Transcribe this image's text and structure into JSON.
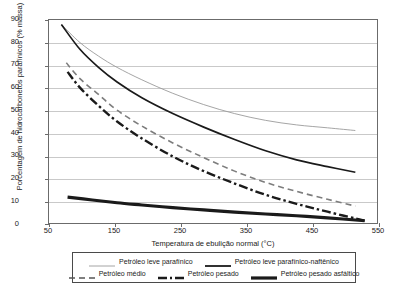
{
  "chart_data": {
    "type": "line",
    "title": "",
    "xlabel": "Temperatura de ebulição normal (°C)",
    "ylabel": "Porcentagem de hidrocarbonetos parafínicos (% massa)",
    "xlim": [
      50,
      580
    ],
    "ylim": [
      0,
      90
    ],
    "xticks": [
      50,
      150,
      250,
      350,
      450,
      550
    ],
    "yticks": [
      0,
      10,
      20,
      30,
      40,
      50,
      60,
      70,
      80,
      90
    ],
    "grid": "horizontal",
    "legend_position": "bottom",
    "series": [
      {
        "name": "Petróleo leve parafínico",
        "style": "thin-solid-gray",
        "color": "#9a9a9a",
        "width": 0.9,
        "points": [
          [
            70,
            88
          ],
          [
            100,
            80
          ],
          [
            130,
            74
          ],
          [
            160,
            69
          ],
          [
            200,
            63.5
          ],
          [
            250,
            57.5
          ],
          [
            300,
            52.5
          ],
          [
            350,
            48.5
          ],
          [
            400,
            45.5
          ],
          [
            450,
            43.5
          ],
          [
            500,
            42.2
          ],
          [
            545,
            41
          ]
        ]
      },
      {
        "name": "Petróleo leve parafínico-naftênico",
        "style": "medium-solid-black",
        "color": "#1a1a1a",
        "width": 1.7,
        "points": [
          [
            70,
            88
          ],
          [
            100,
            77
          ],
          [
            130,
            69
          ],
          [
            160,
            62.5
          ],
          [
            200,
            55.5
          ],
          [
            250,
            48.5
          ],
          [
            300,
            42.5
          ],
          [
            350,
            37
          ],
          [
            400,
            32
          ],
          [
            450,
            28
          ],
          [
            500,
            25
          ],
          [
            545,
            22.5
          ]
        ]
      },
      {
        "name": "Petróleo médio",
        "style": "dashed-gray",
        "color": "#7d7d7d",
        "width": 1.6,
        "points": [
          [
            78,
            71
          ],
          [
            100,
            64
          ],
          [
            130,
            57
          ],
          [
            160,
            50
          ],
          [
            200,
            43
          ],
          [
            250,
            35.5
          ],
          [
            300,
            29
          ],
          [
            350,
            23
          ],
          [
            400,
            18
          ],
          [
            450,
            14
          ],
          [
            500,
            10.5
          ],
          [
            545,
            7.5
          ]
        ]
      },
      {
        "name": "Petróleo pesado",
        "style": "dash-dot-black",
        "color": "#1a1a1a",
        "width": 2.4,
        "points": [
          [
            80,
            67
          ],
          [
            100,
            60
          ],
          [
            130,
            52
          ],
          [
            160,
            45
          ],
          [
            200,
            37.5
          ],
          [
            250,
            29.5
          ],
          [
            300,
            23
          ],
          [
            350,
            17.5
          ],
          [
            400,
            12.5
          ],
          [
            450,
            8.5
          ],
          [
            500,
            5
          ],
          [
            560,
            1
          ]
        ]
      },
      {
        "name": "Petróleo pesado asfáltico",
        "style": "thick-solid-black",
        "color": "#1a1a1a",
        "width": 3.2,
        "points": [
          [
            80,
            11.5
          ],
          [
            120,
            10.2
          ],
          [
            160,
            9
          ],
          [
            200,
            8
          ],
          [
            250,
            6.8
          ],
          [
            300,
            5.8
          ],
          [
            350,
            4.8
          ],
          [
            400,
            4
          ],
          [
            450,
            3.2
          ],
          [
            500,
            2.3
          ],
          [
            560,
            1
          ]
        ]
      }
    ]
  },
  "axes": {
    "y_title": "Porcentagem de hidrocarbonetos parafínicos (% massa)",
    "x_title": "Temperatura de ebulição normal (°C)",
    "y_tick_labels": [
      "90",
      "80",
      "70",
      "60",
      "50",
      "40",
      "30",
      "20",
      "10",
      "0"
    ],
    "x_tick_labels": [
      "50",
      "150",
      "250",
      "350",
      "450",
      "550"
    ]
  },
  "legend": {
    "row1": [
      {
        "label": "Petróleo leve parafínico",
        "style": "thin-solid-gray"
      },
      {
        "label": "Petróleo leve parafínico-naftênico",
        "style": "medium-solid-black"
      }
    ],
    "row2": [
      {
        "label": "Petróleo médio",
        "style": "dashed-gray"
      },
      {
        "label": "Petróleo pesado",
        "style": "dash-dot-black"
      },
      {
        "label": "Petróleo pesado asfáltico",
        "style": "thick-solid-black"
      }
    ]
  }
}
